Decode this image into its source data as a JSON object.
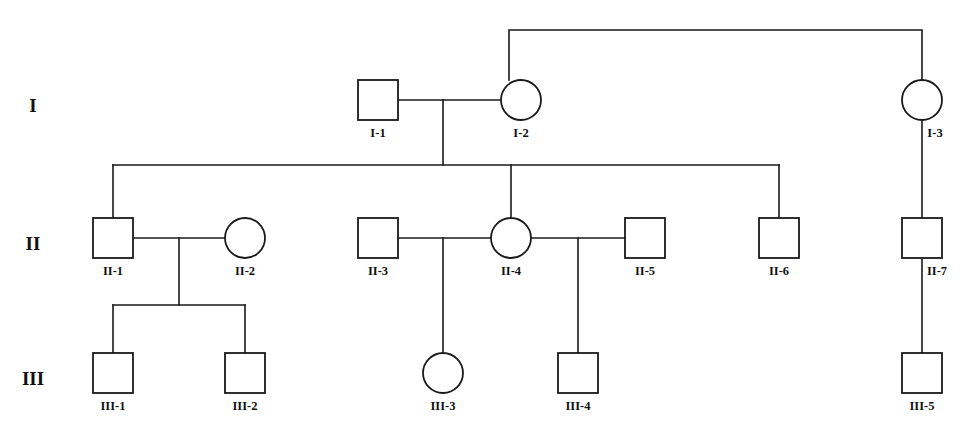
{
  "diagram": {
    "type": "pedigree-chart",
    "width": 970,
    "height": 426,
    "background_color": "#ffffff",
    "line_color": "#1a1a1a",
    "shape_fill": "#ffffff",
    "shape_count": 15,
    "generation_count": 3
  },
  "generations": [
    {
      "id": "gen-I",
      "label": "I",
      "x": 33,
      "y": 105
    },
    {
      "id": "gen-II",
      "label": "II",
      "x": 33,
      "y": 243
    },
    {
      "id": "gen-III",
      "label": "III",
      "x": 33,
      "y": 378
    }
  ],
  "individuals": [
    {
      "id": "I-1",
      "label": "I-1",
      "sex": "male",
      "shape": "square",
      "affected": false,
      "cx": 378,
      "cy": 100,
      "size": 40,
      "label_x": 378,
      "label_y": 133
    },
    {
      "id": "I-2",
      "label": "I-2",
      "sex": "female",
      "shape": "circle",
      "affected": false,
      "cx": 521,
      "cy": 100,
      "size": 40,
      "label_x": 521,
      "label_y": 133
    },
    {
      "id": "I-3",
      "label": "I-3",
      "sex": "female",
      "shape": "circle",
      "affected": false,
      "cx": 922,
      "cy": 100,
      "size": 40,
      "label_x": 935,
      "label_y": 133
    },
    {
      "id": "II-1",
      "label": "II-1",
      "sex": "male",
      "shape": "square",
      "affected": false,
      "cx": 113,
      "cy": 238,
      "size": 40,
      "label_x": 113,
      "label_y": 271
    },
    {
      "id": "II-2",
      "label": "II-2",
      "sex": "female",
      "shape": "circle",
      "affected": false,
      "cx": 245,
      "cy": 238,
      "size": 40,
      "label_x": 245,
      "label_y": 271
    },
    {
      "id": "II-3",
      "label": "II-3",
      "sex": "male",
      "shape": "square",
      "affected": false,
      "cx": 378,
      "cy": 238,
      "size": 40,
      "label_x": 378,
      "label_y": 271
    },
    {
      "id": "II-4",
      "label": "II-4",
      "sex": "female",
      "shape": "circle",
      "affected": false,
      "cx": 511,
      "cy": 238,
      "size": 40,
      "label_x": 511,
      "label_y": 271
    },
    {
      "id": "II-5",
      "label": "II-5",
      "sex": "male",
      "shape": "square",
      "affected": false,
      "cx": 645,
      "cy": 238,
      "size": 40,
      "label_x": 645,
      "label_y": 271
    },
    {
      "id": "II-6",
      "label": "II-6",
      "sex": "male",
      "shape": "square",
      "affected": false,
      "cx": 779,
      "cy": 238,
      "size": 40,
      "label_x": 779,
      "label_y": 271
    },
    {
      "id": "II-7",
      "label": "II-7",
      "sex": "male",
      "shape": "square",
      "affected": false,
      "cx": 922,
      "cy": 238,
      "size": 40,
      "label_x": 935,
      "label_y": 271
    },
    {
      "id": "III-1",
      "label": "III-1",
      "sex": "male",
      "shape": "square",
      "affected": false,
      "cx": 113,
      "cy": 373,
      "size": 40,
      "label_x": 113,
      "label_y": 406
    },
    {
      "id": "III-2",
      "label": "III-2",
      "sex": "male",
      "shape": "square",
      "affected": false,
      "cx": 245,
      "cy": 373,
      "size": 40,
      "label_x": 245,
      "label_y": 406
    },
    {
      "id": "III-3",
      "label": "III-3",
      "sex": "female",
      "shape": "circle",
      "affected": false,
      "cx": 443,
      "cy": 373,
      "size": 40,
      "label_x": 443,
      "label_y": 406
    },
    {
      "id": "III-4",
      "label": "III-4",
      "sex": "male",
      "shape": "square",
      "affected": false,
      "cx": 578,
      "cy": 373,
      "size": 40,
      "label_x": 578,
      "label_y": 406
    },
    {
      "id": "III-5",
      "label": "III-5",
      "sex": "male",
      "shape": "square",
      "affected": false,
      "cx": 922,
      "cy": 373,
      "size": 40,
      "label_x": 922,
      "label_y": 406
    }
  ],
  "matings": [
    {
      "id": "mating-I1-I2",
      "partners": [
        "I-1",
        "I-2"
      ],
      "mating_line_y": 100,
      "x1": 398,
      "x2": 502,
      "drop_x": 443,
      "drop_to_y": 165
    },
    {
      "id": "mating-II1-II2",
      "partners": [
        "II-1",
        "II-2"
      ],
      "mating_line_y": 238,
      "x1": 133,
      "x2": 226,
      "drop_x": 179,
      "drop_to_y": 305
    },
    {
      "id": "mating-II3-II4",
      "partners": [
        "II-3",
        "II-4"
      ],
      "mating_line_y": 238,
      "x1": 398,
      "x2": 492,
      "drop_x": 443,
      "drop_to_y": 353
    },
    {
      "id": "mating-II4-II5",
      "partners": [
        "II-4",
        "II-5"
      ],
      "mating_line_y": 238,
      "x1": 530,
      "x2": 625,
      "drop_x": 578,
      "drop_to_y": 353
    }
  ],
  "sibships": [
    {
      "id": "sibship-gen-I",
      "note": "top sibship bar joining I-2 and I-3",
      "bar_y": 30,
      "x_left": 509,
      "x_right": 922,
      "drops": [
        {
          "to": "I-2",
          "x": 509,
          "y_end": 80
        },
        {
          "to": "I-3",
          "x": 922,
          "y_end": 80
        }
      ]
    },
    {
      "id": "sibship-gen-II",
      "note": "children of I-1 x I-2",
      "bar_y": 165,
      "x_left": 113,
      "x_right": 779,
      "drops": [
        {
          "to": "II-1",
          "x": 113,
          "y_end": 218
        },
        {
          "to": "II-4",
          "x": 511,
          "y_end": 218
        },
        {
          "to": "II-6",
          "x": 779,
          "y_end": 218
        }
      ]
    },
    {
      "id": "sibship-gen-III-a",
      "note": "children of II-1 x II-2",
      "bar_y": 305,
      "x_left": 113,
      "x_right": 245,
      "drops": [
        {
          "to": "III-1",
          "x": 113,
          "y_end": 353
        },
        {
          "to": "III-2",
          "x": 245,
          "y_end": 353
        }
      ]
    }
  ],
  "direct_descents": [
    {
      "id": "descent-I3-II7",
      "from": "I-3",
      "to": "II-7",
      "x": 922,
      "y1": 120,
      "y2": 218
    },
    {
      "id": "descent-II7-III5",
      "from": "II-7",
      "to": "III-5",
      "x": 922,
      "y1": 258,
      "y2": 353
    },
    {
      "id": "descent-II34-III3",
      "from": "mating-II3-II4",
      "to": "III-3",
      "x": 443,
      "y1": 258,
      "y2": 353
    },
    {
      "id": "descent-II45-III4",
      "from": "mating-II4-II5",
      "to": "III-4",
      "x": 578,
      "y1": 258,
      "y2": 353
    }
  ]
}
